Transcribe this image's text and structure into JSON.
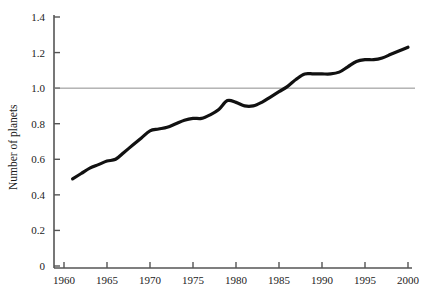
{
  "chart_data": {
    "type": "line",
    "title": "",
    "subtitle": "",
    "xlabel": "",
    "ylabel": "Number of planets",
    "xlim": [
      1960,
      2000
    ],
    "ylim": [
      0,
      1.4
    ],
    "grid": false,
    "legend": null,
    "legend_position": "none",
    "background_color": "#ffffff",
    "series": [
      {
        "name": "Number of planets",
        "color": "#111111",
        "line_width": 3.2,
        "x": [
          1961,
          1962,
          1963,
          1964,
          1965,
          1966,
          1967,
          1968,
          1969,
          1970,
          1971,
          1972,
          1973,
          1974,
          1975,
          1976,
          1977,
          1978,
          1979,
          1980,
          1981,
          1982,
          1983,
          1984,
          1985,
          1986,
          1987,
          1988,
          1989,
          1990,
          1991,
          1992,
          1993,
          1994,
          1995,
          1996,
          1997,
          1998,
          1999,
          2000
        ],
        "values": [
          0.49,
          0.52,
          0.55,
          0.57,
          0.59,
          0.6,
          0.64,
          0.68,
          0.72,
          0.76,
          0.77,
          0.78,
          0.8,
          0.82,
          0.83,
          0.83,
          0.85,
          0.88,
          0.93,
          0.92,
          0.9,
          0.9,
          0.92,
          0.95,
          0.98,
          1.01,
          1.05,
          1.08,
          1.08,
          1.08,
          1.08,
          1.09,
          1.12,
          1.15,
          1.16,
          1.16,
          1.17,
          1.19,
          1.21,
          1.23
        ]
      }
    ],
    "reference_lines": [
      {
        "name": "unity-reference-line",
        "axis": "y",
        "value": 1.0,
        "color": "#8c8c8c",
        "line_width": 1
      }
    ],
    "xticks": [
      1960,
      1965,
      1970,
      1975,
      1980,
      1985,
      1990,
      1995,
      2000
    ],
    "xtick_labels": [
      "1960",
      "1965",
      "1970",
      "1975",
      "1980",
      "1985",
      "1990",
      "1995",
      "2000"
    ],
    "yticks": [
      0,
      0.2,
      0.4,
      0.6,
      0.8,
      1.0,
      1.2,
      1.4
    ],
    "ytick_labels": [
      "0",
      "0.2",
      "0.4",
      "0.6",
      "0.8",
      "1.0",
      "1.2",
      "1.4"
    ],
    "axis_color": "#555555"
  }
}
